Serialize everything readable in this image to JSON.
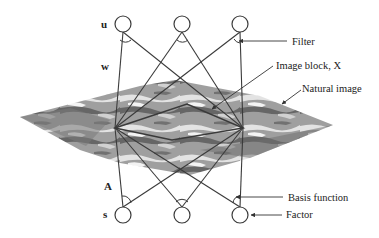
{
  "diagram": {
    "variables": {
      "u": "u",
      "w": "w",
      "A": "A",
      "s": "s"
    },
    "annotations": {
      "filter": "Filter",
      "image_block": "Image block, X",
      "natural_image": "Natural image",
      "basis_function": "Basis function",
      "factor": "Factor"
    },
    "top_layer": {
      "name": "u",
      "node_count": 3
    },
    "bottom_layer": {
      "name": "s",
      "node_count": 3
    },
    "colors": {
      "line": "#3a3a3a",
      "image_dark": "#5a5a5a",
      "image_mid": "#8c8c8c",
      "image_light": "#d8d8d8"
    }
  }
}
